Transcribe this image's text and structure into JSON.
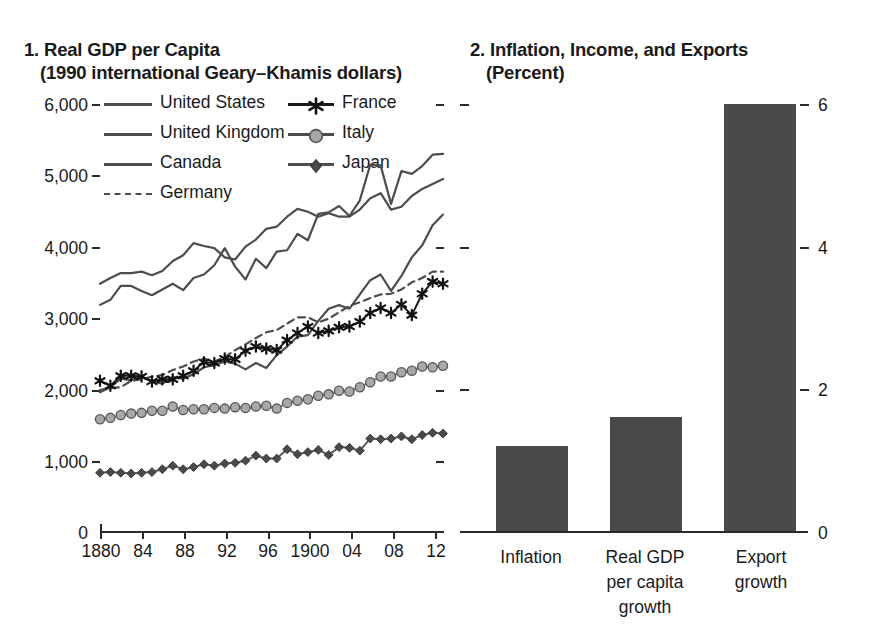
{
  "figure": {
    "panels": [
      {
        "number": "1.",
        "title_line1": "1. Real GDP per Capita",
        "title_line2": "(1990 international Geary–Khamis dollars)"
      },
      {
        "number": "2.",
        "title_line1": "2. Inflation, Income, and Exports",
        "title_line2": "(Percent)"
      }
    ]
  },
  "chart_data": [
    {
      "type": "line",
      "title": "1. Real GDP per Capita",
      "subtitle": "(1990 international Geary–Khamis dollars)",
      "xlabel": "",
      "ylabel": "",
      "ylim": [
        0,
        6000
      ],
      "yticks": [
        0,
        1000,
        2000,
        3000,
        4000,
        5000,
        6000
      ],
      "yticklabels": [
        "0",
        "1,000",
        "2,000",
        "3,000",
        "4,000",
        "5,000",
        "6,000"
      ],
      "xlim": [
        1880,
        1913
      ],
      "xticks": [
        1880,
        1884,
        1888,
        1892,
        1896,
        1900,
        1904,
        1908,
        1912
      ],
      "xticklabels": [
        "1880",
        "84",
        "88",
        "92",
        "96",
        "1900",
        "04",
        "08",
        "12"
      ],
      "grid": false,
      "legend_position": "upper-left-inside",
      "x": [
        1880,
        1881,
        1882,
        1883,
        1884,
        1885,
        1886,
        1887,
        1888,
        1889,
        1890,
        1891,
        1892,
        1893,
        1894,
        1895,
        1896,
        1897,
        1898,
        1899,
        1900,
        1901,
        1902,
        1903,
        1904,
        1905,
        1906,
        1907,
        1908,
        1909,
        1910,
        1911,
        1912,
        1913
      ],
      "series": [
        {
          "name": "United States",
          "marker": "none",
          "style": "solid",
          "color": "#4d4d4d",
          "values": [
            3184,
            3255,
            3450,
            3450,
            3380,
            3320,
            3400,
            3480,
            3390,
            3560,
            3610,
            3740,
            3980,
            3720,
            3540,
            3830,
            3700,
            3930,
            3950,
            4180,
            4090,
            4460,
            4480,
            4570,
            4430,
            4650,
            5150,
            5140,
            4600,
            5060,
            5020,
            5130,
            5290,
            5300
          ]
        },
        {
          "name": "United Kingdom",
          "marker": "none",
          "style": "solid",
          "color": "#4d4d4d",
          "values": [
            3480,
            3560,
            3630,
            3630,
            3650,
            3600,
            3660,
            3800,
            3880,
            4050,
            4010,
            3980,
            3850,
            3820,
            4000,
            4100,
            4250,
            4280,
            4420,
            4530,
            4490,
            4420,
            4470,
            4420,
            4420,
            4520,
            4680,
            4750,
            4520,
            4560,
            4710,
            4810,
            4880,
            4950
          ]
        },
        {
          "name": "Canada",
          "marker": "none",
          "style": "solid",
          "color": "#4d4d4d",
          "values": [
            1960,
            2030,
            2150,
            2130,
            2180,
            2110,
            2080,
            2170,
            2150,
            2210,
            2310,
            2340,
            2390,
            2360,
            2280,
            2370,
            2300,
            2480,
            2600,
            2740,
            2760,
            2960,
            3130,
            3180,
            3130,
            3330,
            3530,
            3610,
            3380,
            3590,
            3850,
            4020,
            4300,
            4450
          ]
        },
        {
          "name": "Germany",
          "marker": "none",
          "style": "dashed",
          "color": "#4d4d4d",
          "values": [
            1990,
            2020,
            2030,
            2120,
            2140,
            2180,
            2200,
            2270,
            2320,
            2390,
            2430,
            2390,
            2450,
            2550,
            2630,
            2720,
            2800,
            2830,
            2920,
            3010,
            3010,
            2940,
            2990,
            3080,
            3170,
            3220,
            3280,
            3330,
            3340,
            3400,
            3500,
            3560,
            3650,
            3650
          ]
        },
        {
          "name": "France",
          "marker": "star",
          "style": "solid",
          "color": "#1a1a1a",
          "values": [
            2120,
            2050,
            2190,
            2190,
            2180,
            2110,
            2140,
            2140,
            2190,
            2260,
            2380,
            2370,
            2430,
            2420,
            2540,
            2600,
            2570,
            2550,
            2690,
            2790,
            2880,
            2790,
            2820,
            2870,
            2880,
            2950,
            3070,
            3140,
            3070,
            3190,
            3040,
            3340,
            3510,
            3480
          ]
        },
        {
          "name": "Italy",
          "marker": "circle",
          "style": "solid",
          "color": "#808080",
          "values": [
            1580,
            1600,
            1640,
            1660,
            1670,
            1700,
            1700,
            1760,
            1710,
            1720,
            1720,
            1740,
            1730,
            1750,
            1740,
            1760,
            1770,
            1730,
            1810,
            1840,
            1860,
            1910,
            1930,
            1980,
            1970,
            2030,
            2100,
            2180,
            2180,
            2240,
            2260,
            2320,
            2310,
            2330
          ]
        },
        {
          "name": "Japan",
          "marker": "diamond",
          "style": "solid",
          "color": "#5a5a5a",
          "values": [
            830,
            840,
            830,
            820,
            830,
            840,
            880,
            930,
            880,
            910,
            950,
            930,
            960,
            970,
            1000,
            1070,
            1030,
            1030,
            1160,
            1090,
            1120,
            1150,
            1080,
            1190,
            1180,
            1140,
            1310,
            1300,
            1310,
            1340,
            1300,
            1360,
            1390,
            1380
          ]
        }
      ]
    },
    {
      "type": "bar",
      "title": "2. Inflation, Income, and Exports",
      "subtitle": "(Percent)",
      "xlabel": "",
      "ylabel": "",
      "ylim": [
        0,
        6.5
      ],
      "yticks": [
        0,
        2,
        4,
        6
      ],
      "yticklabels": [
        "0",
        "2",
        "4",
        "6"
      ],
      "grid": false,
      "bar_color": "#4a4a4a",
      "categories": [
        "Inflation",
        "Real GDP per capita growth",
        "Export growth"
      ],
      "category_lines": [
        [
          "Inflation"
        ],
        [
          "Real GDP",
          "per capita",
          "growth"
        ],
        [
          "Export",
          "growth"
        ]
      ],
      "values": [
        1.2,
        1.6,
        6.0
      ]
    }
  ]
}
